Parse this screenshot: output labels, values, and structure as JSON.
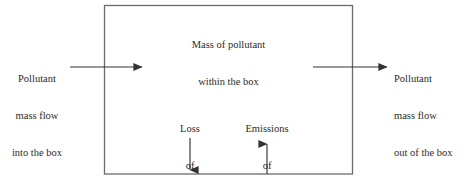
{
  "diagram": {
    "box": {
      "label_line1": "Mass of pollutant",
      "label_line2": "within the box",
      "stroke_color": "#6b6b6b",
      "fill_color": "#ffffff"
    },
    "inflow": {
      "label_line1": "Pollutant",
      "label_line2": "mass flow",
      "label_line3": "into the box",
      "arrow_direction": "right",
      "arrow_color": "#333333"
    },
    "outflow": {
      "label_line1": "Pollutant",
      "label_line2": "mass flow",
      "label_line3": "out of the box",
      "arrow_direction": "right",
      "arrow_color": "#333333"
    },
    "loss": {
      "label_line1": "Loss",
      "label_line2": "of",
      "label_line3": "pollutant",
      "arrow_direction": "down",
      "arrow_color": "#333333"
    },
    "emissions": {
      "label_line1": "Emissions",
      "label_line2": "of",
      "label_line3": "pollutant",
      "arrow_direction": "up",
      "arrow_color": "#333333"
    },
    "colors": {
      "background": "#ffffff",
      "text": "#2b2b2b",
      "line": "#333333",
      "box_border": "#6b6b6b"
    }
  }
}
